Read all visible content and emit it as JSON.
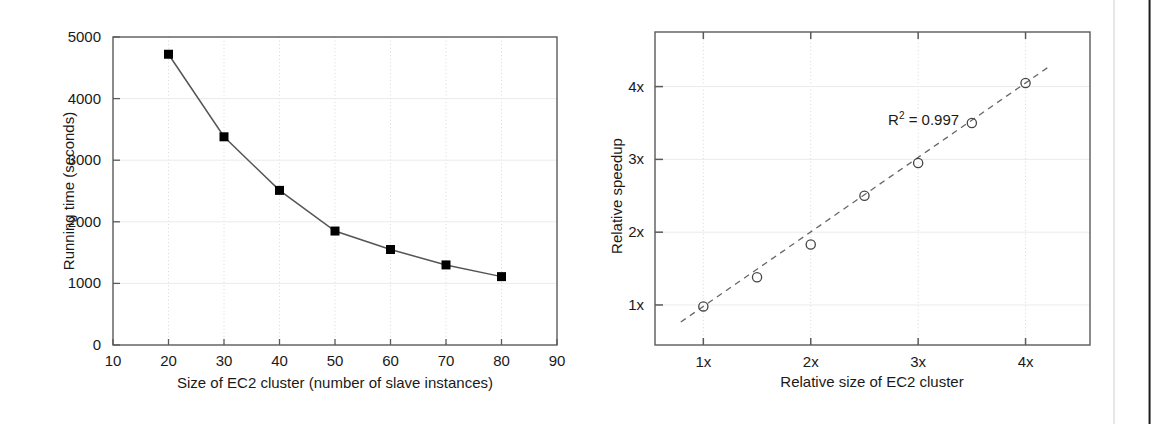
{
  "chart_data": [
    {
      "type": "line",
      "title": "",
      "xlabel": "Size of EC2 cluster (number of slave instances)",
      "ylabel": "Running time (seconds)",
      "x": [
        20,
        30,
        40,
        50,
        60,
        70,
        80
      ],
      "values": [
        4720,
        3380,
        2510,
        1850,
        1550,
        1300,
        1110
      ],
      "xlim": [
        10,
        90
      ],
      "ylim": [
        0,
        5000
      ],
      "xticks": [
        "10",
        "20",
        "30",
        "40",
        "50",
        "60",
        "70",
        "80",
        "90"
      ],
      "xtick_values": [
        10,
        20,
        30,
        40,
        50,
        60,
        70,
        80,
        90
      ],
      "yticks": [
        "0",
        "1000",
        "2000",
        "3000",
        "4000",
        "5000"
      ],
      "ytick_values": [
        0,
        1000,
        2000,
        3000,
        4000,
        5000
      ],
      "grid": true,
      "legend": "none",
      "marker": "filled-square",
      "line_style": "solid",
      "line_color": "#555555",
      "marker_color": "#000000"
    },
    {
      "type": "scatter",
      "title": "",
      "xlabel": "Relative size of EC2 cluster",
      "ylabel": "Relative speedup",
      "x": [
        1,
        1.5,
        2,
        2.5,
        3,
        3.5,
        4
      ],
      "values": [
        0.98,
        1.38,
        1.83,
        2.5,
        2.95,
        3.5,
        4.05
      ],
      "xlim": [
        0.55,
        4.6
      ],
      "ylim": [
        0.45,
        4.75
      ],
      "xticks": [
        "1x",
        "2x",
        "3x",
        "4x"
      ],
      "xtick_values": [
        1,
        2,
        3,
        4
      ],
      "yticks": [
        "1x",
        "2x",
        "3x",
        "4x"
      ],
      "ytick_values": [
        1,
        2,
        3,
        4
      ],
      "grid": true,
      "legend": "none",
      "marker": "open-circle",
      "line_style": "dashed",
      "line_color": "#555555",
      "marker_color": "#444444",
      "annotations": [
        {
          "text_main": "R",
          "text_sup": "2",
          "text_rest": " = 0.997",
          "x": 2.72,
          "y": 3.47
        }
      ]
    }
  ]
}
